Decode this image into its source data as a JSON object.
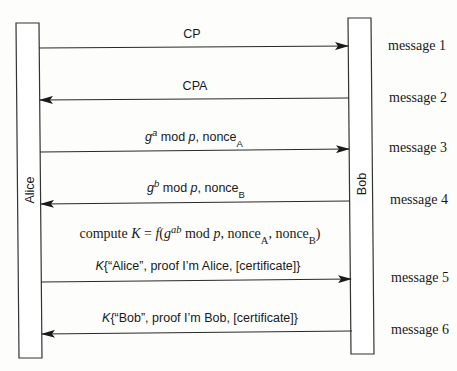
{
  "diagram": {
    "type": "sequence",
    "participants": [
      {
        "name": "Alice"
      },
      {
        "name": "Bob"
      }
    ],
    "messages": [
      {
        "index": 1,
        "label": "message 1",
        "direction": "Alice->Bob",
        "text": "CP"
      },
      {
        "index": 2,
        "label": "message 2",
        "direction": "Bob->Alice",
        "text": "CPA"
      },
      {
        "index": 3,
        "label": "message 3",
        "direction": "Alice->Bob",
        "text_parts": {
          "g": "g",
          "exp": "a",
          "mid": " mod ",
          "p": "p",
          "rest": ", nonce",
          "sub": "A"
        }
      },
      {
        "index": 4,
        "label": "message 4",
        "direction": "Bob->Alice",
        "text_parts": {
          "g": "g",
          "exp": "b",
          "mid": " mod ",
          "p": "p",
          "rest": ", nonce",
          "sub": "B"
        }
      },
      {
        "index": 5,
        "label": "message 5",
        "direction": "Alice->Bob",
        "text_parts": {
          "k": "K",
          "rest": "{“Alice”, proof I’m Alice, [certificate]}"
        }
      },
      {
        "index": 6,
        "label": "message 6",
        "direction": "Bob->Alice",
        "text_parts": {
          "k": "K",
          "rest": "{“Bob”, proof I’m Bob, [certificate]}"
        }
      }
    ],
    "computation": {
      "prefix": "compute ",
      "k": "K",
      "eq": " = ",
      "f": "f",
      "open": "(",
      "g": "g",
      "exp": "ab",
      "mod": " mod ",
      "p": "p",
      "nonce1": ", nonce",
      "sub1": "A",
      "nonce2": ", nonce",
      "sub2": "B",
      "close": ")"
    }
  }
}
